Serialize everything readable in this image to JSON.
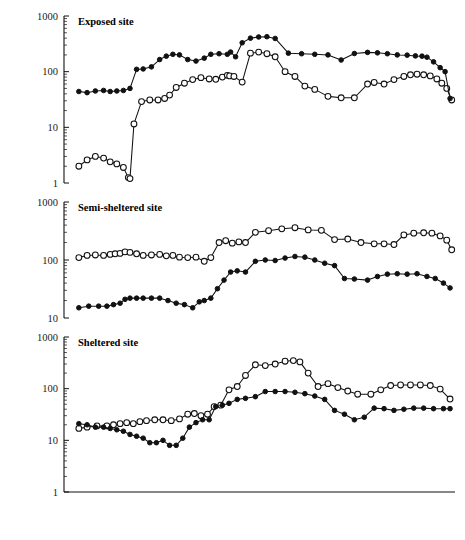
{
  "figure": {
    "y_axis_label": "Population density (no. of individuals/m²)",
    "x_axis_label": "Year",
    "caption": ""
  },
  "legend": {
    "position": "inside-upper-right-of-panel-1",
    "items": [
      {
        "label": "Shallow water",
        "marker": "open-circle"
      },
      {
        "label": "Deep water",
        "marker": "filled-circle"
      }
    ]
  },
  "chart_data": [
    {
      "type": "line",
      "title": "Exposed site",
      "xlabel": "Year",
      "ylabel": "Population density (no. of individuals/m²)",
      "yscale": "log",
      "ylim": [
        1,
        1000
      ],
      "yticks": [
        1,
        10,
        100,
        1000
      ],
      "ytick_labels": [
        "1",
        "10",
        "100",
        "1000"
      ],
      "xlim": [
        1970.6,
        1982.45
      ],
      "xticks": [
        1970.6,
        1971.6,
        1972.6,
        1973.6,
        1974.6,
        1975.6,
        1976.6,
        1977.6,
        1978.6,
        1979.6,
        1980.6,
        1981.6,
        1982.45
      ],
      "xtick_labels": [
        "1971",
        "1972",
        "1973",
        "1974",
        "1975",
        "1976",
        "1977",
        "1978",
        "1979",
        "1980",
        "1981",
        "1982"
      ],
      "grid": false,
      "series": [
        {
          "name": "Shallow water",
          "marker": "open-circle",
          "x": [
            1971.05,
            1971.3,
            1971.55,
            1971.8,
            1972.0,
            1972.2,
            1972.4,
            1972.55,
            1972.6,
            1972.72,
            1972.95,
            1973.2,
            1973.45,
            1973.65,
            1973.8,
            1974.0,
            1974.25,
            1974.5,
            1974.75,
            1975.0,
            1975.2,
            1975.4,
            1975.55,
            1975.62,
            1975.75,
            1976.0,
            1976.25,
            1976.5,
            1976.75,
            1977.0,
            1977.3,
            1977.6,
            1977.9,
            1978.2,
            1978.6,
            1979.0,
            1979.4,
            1979.8,
            1980.0,
            1980.3,
            1980.6,
            1980.9,
            1981.1,
            1981.3,
            1981.5,
            1981.7,
            1981.9,
            1982.05,
            1982.2,
            1982.35
          ],
          "y": [
            2.0,
            2.6,
            3.0,
            2.8,
            2.4,
            2.2,
            1.9,
            1.25,
            1.2,
            11.5,
            29,
            31,
            31,
            33,
            38,
            52,
            62,
            72,
            78,
            74,
            73,
            80,
            86,
            84,
            82,
            65,
            215,
            225,
            210,
            185,
            100,
            82,
            55,
            48,
            36,
            34,
            34,
            60,
            64,
            60,
            72,
            82,
            88,
            90,
            88,
            84,
            74,
            62,
            50,
            31
          ]
        },
        {
          "name": "Deep water",
          "marker": "filled-circle",
          "x": [
            1971.05,
            1971.3,
            1971.55,
            1971.8,
            1972.0,
            1972.2,
            1972.4,
            1972.6,
            1972.8,
            1973.0,
            1973.25,
            1973.5,
            1973.7,
            1973.9,
            1974.1,
            1974.35,
            1974.6,
            1974.85,
            1975.05,
            1975.3,
            1975.55,
            1975.65,
            1975.8,
            1976.0,
            1976.25,
            1976.5,
            1976.75,
            1977.0,
            1977.4,
            1977.8,
            1978.2,
            1978.6,
            1979.0,
            1979.4,
            1979.8,
            1980.1,
            1980.4,
            1980.7,
            1981.0,
            1981.25,
            1981.45,
            1981.6,
            1981.8,
            1982.0,
            1982.15,
            1982.3
          ],
          "y": [
            44,
            42,
            45,
            46,
            44,
            45,
            46,
            50,
            110,
            112,
            122,
            165,
            190,
            205,
            200,
            165,
            155,
            175,
            205,
            210,
            205,
            225,
            185,
            330,
            400,
            420,
            425,
            395,
            215,
            210,
            205,
            200,
            162,
            212,
            222,
            218,
            210,
            200,
            198,
            192,
            190,
            182,
            150,
            118,
            100,
            33
          ]
        }
      ]
    },
    {
      "type": "line",
      "title": "Semi-sheltered site",
      "xlabel": "Year",
      "ylabel": "Population density (no. of individuals/m²)",
      "yscale": "log",
      "ylim": [
        10,
        1000
      ],
      "yticks": [
        10,
        100,
        1000
      ],
      "ytick_labels": [
        "10",
        "100",
        "1000"
      ],
      "xlim": [
        1970.6,
        1982.45
      ],
      "grid": false,
      "series": [
        {
          "name": "Shallow water",
          "marker": "open-circle",
          "x": [
            1971.05,
            1971.3,
            1971.55,
            1971.8,
            1972.0,
            1972.15,
            1972.3,
            1972.45,
            1972.6,
            1972.8,
            1973.0,
            1973.25,
            1973.5,
            1973.7,
            1973.9,
            1974.1,
            1974.35,
            1974.6,
            1974.85,
            1975.05,
            1975.3,
            1975.5,
            1975.7,
            1975.9,
            1976.1,
            1976.4,
            1976.8,
            1977.2,
            1977.6,
            1978.0,
            1978.4,
            1978.8,
            1979.2,
            1979.6,
            1980.0,
            1980.3,
            1980.6,
            1980.9,
            1981.2,
            1981.5,
            1981.75,
            1982.0,
            1982.2,
            1982.35
          ],
          "y": [
            110,
            120,
            122,
            120,
            125,
            128,
            130,
            138,
            135,
            128,
            120,
            122,
            125,
            118,
            120,
            112,
            110,
            112,
            95,
            110,
            200,
            215,
            195,
            205,
            200,
            300,
            320,
            345,
            360,
            330,
            325,
            225,
            230,
            200,
            190,
            190,
            185,
            270,
            290,
            295,
            290,
            260,
            220,
            150
          ]
        },
        {
          "name": "Deep water",
          "marker": "filled-circle",
          "x": [
            1971.05,
            1971.35,
            1971.65,
            1971.9,
            1972.1,
            1972.3,
            1972.45,
            1972.6,
            1972.8,
            1973.0,
            1973.25,
            1973.5,
            1973.75,
            1974.0,
            1974.25,
            1974.5,
            1974.7,
            1974.85,
            1975.05,
            1975.25,
            1975.45,
            1975.65,
            1975.85,
            1976.1,
            1976.4,
            1976.7,
            1977.0,
            1977.3,
            1977.6,
            1977.9,
            1978.2,
            1978.5,
            1978.8,
            1979.1,
            1979.4,
            1979.8,
            1980.1,
            1980.4,
            1980.7,
            1981.0,
            1981.3,
            1981.6,
            1981.85,
            1982.1,
            1982.3
          ],
          "y": [
            15,
            16,
            16,
            16,
            17,
            18,
            21,
            22,
            22,
            22,
            22,
            22,
            20,
            18,
            17,
            15,
            19,
            20,
            22,
            32,
            45,
            62,
            65,
            62,
            95,
            100,
            98,
            108,
            115,
            112,
            100,
            88,
            80,
            48,
            47,
            45,
            52,
            57,
            58,
            57,
            58,
            52,
            48,
            40,
            33
          ]
        }
      ]
    },
    {
      "type": "line",
      "title": "Sheltered site",
      "xlabel": "Year",
      "ylabel": "Population density (no. of individuals/m²)",
      "yscale": "log",
      "ylim": [
        1,
        1000
      ],
      "yticks": [
        1,
        10,
        100,
        1000
      ],
      "ytick_labels": [
        "1",
        "10",
        "100",
        "1000"
      ],
      "xlim": [
        1970.6,
        1982.45
      ],
      "grid": false,
      "series": [
        {
          "name": "Shallow water",
          "marker": "open-circle",
          "x": [
            1971.05,
            1971.3,
            1971.6,
            1971.9,
            1972.1,
            1972.3,
            1972.5,
            1972.7,
            1972.9,
            1973.1,
            1973.35,
            1973.6,
            1973.85,
            1974.1,
            1974.35,
            1974.55,
            1974.75,
            1974.95,
            1975.15,
            1975.35,
            1975.6,
            1975.85,
            1976.1,
            1976.4,
            1976.7,
            1977.0,
            1977.3,
            1977.55,
            1977.75,
            1978.0,
            1978.3,
            1978.6,
            1978.9,
            1979.2,
            1979.5,
            1979.9,
            1980.2,
            1980.5,
            1980.8,
            1981.1,
            1981.4,
            1981.7,
            1982.0,
            1982.3
          ],
          "y": [
            17,
            18,
            19,
            19,
            20,
            21,
            22,
            21,
            23,
            24,
            25,
            25,
            24,
            26,
            32,
            33,
            30,
            32,
            45,
            48,
            95,
            110,
            180,
            290,
            280,
            300,
            340,
            350,
            330,
            200,
            110,
            125,
            105,
            90,
            78,
            78,
            95,
            115,
            118,
            118,
            118,
            115,
            98,
            63
          ]
        },
        {
          "name": "Deep water",
          "marker": "filled-circle",
          "x": [
            1971.05,
            1971.3,
            1971.55,
            1971.8,
            1972.0,
            1972.2,
            1972.4,
            1972.6,
            1972.8,
            1973.0,
            1973.2,
            1973.4,
            1973.6,
            1973.8,
            1974.0,
            1974.2,
            1974.4,
            1974.6,
            1974.8,
            1975.0,
            1975.2,
            1975.4,
            1975.6,
            1975.85,
            1976.1,
            1976.4,
            1976.7,
            1977.0,
            1977.3,
            1977.6,
            1977.9,
            1978.2,
            1978.5,
            1978.8,
            1979.1,
            1979.4,
            1979.7,
            1980.0,
            1980.3,
            1980.6,
            1980.9,
            1981.2,
            1981.5,
            1981.8,
            1982.1,
            1982.3
          ],
          "y": [
            21,
            20,
            18,
            18,
            17,
            16,
            15,
            13,
            12,
            11,
            9,
            9,
            10,
            8,
            8,
            11,
            18,
            22,
            25,
            25,
            45,
            48,
            52,
            62,
            65,
            70,
            88,
            88,
            88,
            85,
            80,
            72,
            62,
            38,
            32,
            25,
            28,
            42,
            41,
            38,
            40,
            42,
            42,
            41,
            41,
            41
          ]
        }
      ]
    }
  ]
}
